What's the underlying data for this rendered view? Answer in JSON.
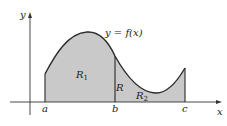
{
  "diagram": {
    "curve_label": "y = f(x)",
    "axis_labels": {
      "x": "x",
      "y": "y"
    },
    "points": {
      "a": "a",
      "b": "b",
      "c": "c"
    },
    "regions": {
      "R1": {
        "letter": "R",
        "sub": "1"
      },
      "R2": {
        "letter": "R",
        "sub": "2"
      },
      "R": {
        "letter": "R"
      }
    },
    "colors": {
      "fill": "#c9c9c9",
      "stroke": "#2a2a2a",
      "axis": "#333333"
    }
  }
}
